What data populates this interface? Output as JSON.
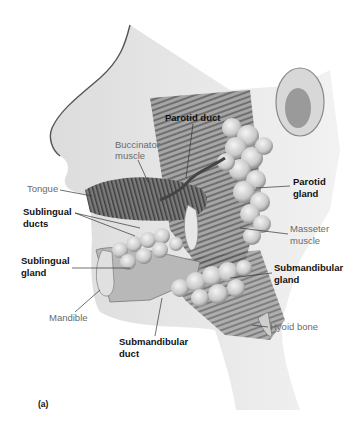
{
  "figure": {
    "panel_label": "(a)"
  },
  "labels": {
    "parotid_duct": "Parotid duct",
    "buccinator_1": "Buccinator",
    "buccinator_2": "muscle",
    "tongue": "Tongue",
    "sublingual_ducts_1": "Sublingual",
    "sublingual_ducts_2": "ducts",
    "sublingual_gland_1": "Sublingual",
    "sublingual_gland_2": "gland",
    "mandible": "Mandible",
    "submandibular_duct_1": "Submandibular",
    "submandibular_duct_2": "duct",
    "parotid_gland_1": "Parotid",
    "parotid_gland_2": "gland",
    "masseter_1": "Masseter",
    "masseter_2": "muscle",
    "submandibular_gland_1": "Submandibular",
    "submandibular_gland_2": "gland",
    "hyoid": "Hyoid bone"
  }
}
